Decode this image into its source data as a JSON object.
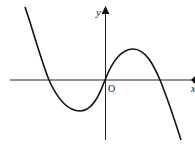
{
  "diagram": {
    "type": "function-graph",
    "axes": {
      "x_label": "x",
      "y_label": "y",
      "origin_label": "O"
    },
    "curve": {
      "shape": "cubic",
      "x_intercepts": [
        "negative",
        "origin",
        "positive"
      ],
      "local_min": "left of y-axis, below x-axis",
      "local_max": "right of y-axis, above x-axis",
      "end_behavior": "rises to the left, falls to the right"
    },
    "colors": {
      "stroke": "#111111",
      "background": "#ffffff"
    }
  }
}
